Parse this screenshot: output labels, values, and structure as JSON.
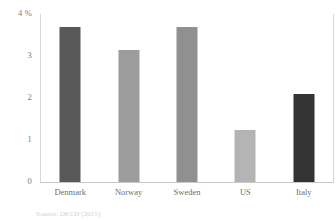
{
  "chart_data": {
    "type": "bar",
    "title": "",
    "subtitle": "",
    "xlabel": "",
    "ylabel": "",
    "unit_label": "%",
    "categories": [
      "Denmark",
      "Norway",
      "Sweden",
      "US",
      "Italy"
    ],
    "values": [
      3.7,
      3.15,
      3.7,
      1.25,
      2.1
    ],
    "bar_colors": [
      "#595959",
      "#9c9c9c",
      "#909090",
      "#b4b4b4",
      "#333333"
    ],
    "ylim": [
      0,
      4
    ],
    "yticks": [
      0,
      1,
      2,
      3,
      4
    ],
    "ytick_labels": [
      "0",
      "1",
      "2",
      "3",
      "4 %"
    ],
    "grid": false,
    "legend": null
  },
  "source_note": "Source: OECD (2015)",
  "axis": {
    "baseline_color": "#c9c9c9",
    "frame_color": "#d8d8d8"
  }
}
